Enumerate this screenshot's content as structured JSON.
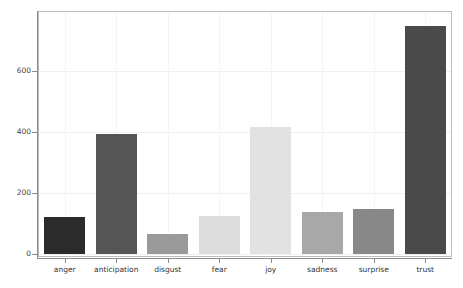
{
  "chart_data": {
    "type": "bar",
    "title": "",
    "subtitle": "",
    "xlabel": "",
    "ylabel": "",
    "categories": [
      "anger",
      "anticipation",
      "disgust",
      "fear",
      "joy",
      "sadness",
      "surprise",
      "trust"
    ],
    "values": [
      120,
      392,
      67,
      126,
      415,
      138,
      148,
      746
    ],
    "series": [
      {
        "name": "emotion word count",
        "values": [
          120,
          392,
          67,
          126,
          415,
          138,
          148,
          746
        ]
      }
    ],
    "bar_colors": [
      "#2b2b2b",
      "#555555",
      "#9a9a9a",
      "#dcdcdc",
      "#e2e2e2",
      "#a8a8a8",
      "#888888",
      "#4a4a4a"
    ],
    "ylim": [
      0,
      760
    ],
    "yticks": [
      0,
      200,
      400,
      600
    ],
    "ytick_labels": [
      "0",
      "200",
      "400",
      "600"
    ],
    "xtick_labels": [
      "anger",
      "anticipation",
      "disgust",
      "fear",
      "joy",
      "sadness",
      "surprise",
      "trust"
    ],
    "grid": true,
    "grid_color": "#f0f0f0",
    "legend": "none",
    "legend_position": "none",
    "background_color": "#ffffff",
    "frame_color": "#bdbdbd",
    "axis_color": "#8a8a8a"
  }
}
